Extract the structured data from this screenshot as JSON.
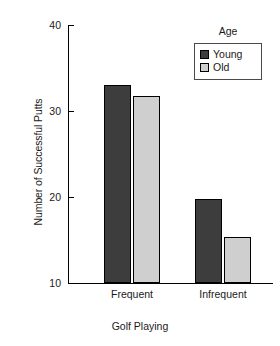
{
  "chart_data": {
    "type": "bar",
    "title": "",
    "xlabel": "Golf Playing",
    "ylabel": "Number of Successful Putts",
    "categories": [
      "Frequent",
      "Infrequent"
    ],
    "series": [
      {
        "name": "Young",
        "color": "#3d3d3d",
        "values": [
          33.0,
          19.8
        ]
      },
      {
        "name": "Old",
        "color": "#cfcfcf",
        "values": [
          31.8,
          15.4
        ]
      }
    ],
    "ylim": [
      10,
      40
    ],
    "yticks": [
      10,
      20,
      30,
      40
    ],
    "ytick_labels": [
      "10",
      "20",
      "30",
      "40"
    ],
    "grid": false,
    "legend": {
      "title": "Age",
      "position": "top-right",
      "entries": [
        {
          "label": "Young",
          "color": "#3d3d3d"
        },
        {
          "label": "Old",
          "color": "#cfcfcf"
        }
      ]
    }
  }
}
